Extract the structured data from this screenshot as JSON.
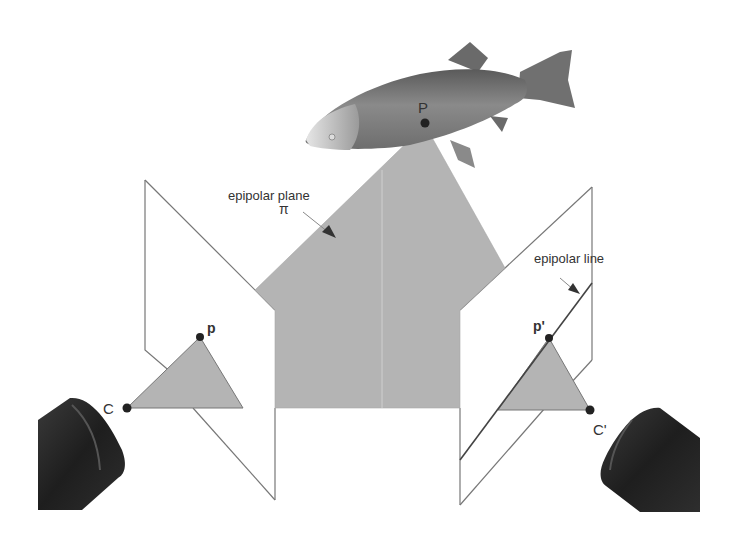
{
  "diagram": {
    "labels": {
      "epipolar_plane": "epipolar plane",
      "plane_symbol": "π",
      "epipolar_line": "epipolar line",
      "world_point": "P",
      "left_image_point": "p",
      "right_image_point": "p'",
      "left_camera_center": "C",
      "right_camera_center": "C'"
    },
    "objects": {
      "fish": "fish-3d-object",
      "left_camera": "camera-lens-left",
      "right_camera": "camera-lens-right",
      "left_image_plane": "image-plane-left",
      "right_image_plane": "image-plane-right"
    },
    "colors": {
      "plane_fill": "#b4b4b4",
      "line": "#555555",
      "dot": "#222222",
      "camera": "#2a2a2a"
    }
  }
}
